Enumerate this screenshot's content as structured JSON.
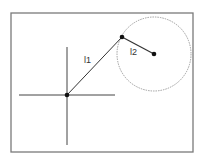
{
  "diagram": {
    "type": "two-link arm",
    "labels": {
      "link1": "l1",
      "link2": "l2"
    },
    "colors": {
      "frame": "#7a7a7a",
      "axes": "#444444",
      "links": "#333333",
      "circle": "#888888",
      "joints": "#111111"
    }
  }
}
